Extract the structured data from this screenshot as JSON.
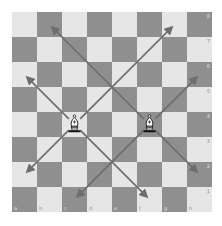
{
  "board": {
    "files": [
      "a",
      "b",
      "c",
      "d",
      "e",
      "f",
      "g",
      "h"
    ],
    "ranks": [
      "8",
      "7",
      "6",
      "5",
      "4",
      "3",
      "2",
      "1"
    ],
    "square_size": 25,
    "colors": {
      "light": "#e6e6e6",
      "dark": "#8f8f8f",
      "arrow": "#6e6e6e"
    },
    "pieces": [
      {
        "type": "bishop",
        "color": "white",
        "square": "c4"
      },
      {
        "type": "bishop",
        "color": "white",
        "square": "f4"
      }
    ],
    "arrows": [
      {
        "from": "c4",
        "to": "a6"
      },
      {
        "from": "c4",
        "to": "g8"
      },
      {
        "from": "c4",
        "to": "a2"
      },
      {
        "from": "c4",
        "to": "f1"
      },
      {
        "from": "f4",
        "to": "b8"
      },
      {
        "from": "f4",
        "to": "h6"
      },
      {
        "from": "f4",
        "to": "c1"
      },
      {
        "from": "f4",
        "to": "h2"
      }
    ]
  }
}
